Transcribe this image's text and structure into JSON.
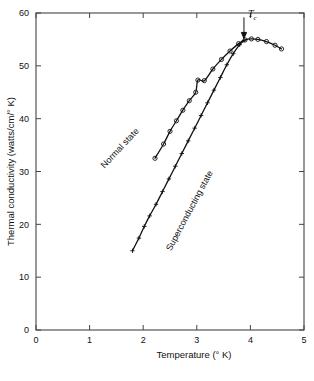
{
  "chart_data": {
    "type": "line",
    "title": "",
    "xlabel": "Temperature (° K)",
    "ylabel": "Thermal conductivity (watts/cm/° K)",
    "xlim": [
      0,
      5
    ],
    "ylim": [
      0,
      60
    ],
    "xticks": [
      0,
      1,
      2,
      3,
      4,
      5
    ],
    "yticks": [
      0,
      10,
      20,
      30,
      40,
      50,
      60
    ],
    "xtick_labels": [
      "0",
      "1",
      "2",
      "3",
      "4",
      "5"
    ],
    "ytick_labels": [
      "0",
      "10",
      "20",
      "30",
      "40",
      "50",
      "60"
    ],
    "grid": false,
    "legend_position": "inline-curve-labels",
    "series": [
      {
        "name": "Normal state",
        "marker": "open-circle",
        "label_rotation_deg": -47,
        "points": [
          {
            "x": 2.22,
            "y": 32.5
          },
          {
            "x": 2.38,
            "y": 35.2
          },
          {
            "x": 2.5,
            "y": 37.6
          },
          {
            "x": 2.62,
            "y": 39.6
          },
          {
            "x": 2.74,
            "y": 41.6
          },
          {
            "x": 2.86,
            "y": 43.4
          },
          {
            "x": 2.98,
            "y": 45.0
          },
          {
            "x": 3.02,
            "y": 47.3
          },
          {
            "x": 3.14,
            "y": 47.2
          },
          {
            "x": 3.3,
            "y": 49.4
          },
          {
            "x": 3.46,
            "y": 51.2
          },
          {
            "x": 3.62,
            "y": 52.8
          },
          {
            "x": 3.78,
            "y": 54.2
          },
          {
            "x": 3.9,
            "y": 54.9
          },
          {
            "x": 4.02,
            "y": 55.1
          },
          {
            "x": 4.14,
            "y": 55.0
          },
          {
            "x": 4.3,
            "y": 54.6
          },
          {
            "x": 4.46,
            "y": 53.9
          },
          {
            "x": 4.58,
            "y": 53.2
          }
        ]
      },
      {
        "name": "Superconducting state",
        "marker": "plus",
        "label_rotation_deg": -62,
        "points": [
          {
            "x": 1.8,
            "y": 15.0
          },
          {
            "x": 1.92,
            "y": 17.4
          },
          {
            "x": 2.02,
            "y": 19.6
          },
          {
            "x": 2.12,
            "y": 21.6
          },
          {
            "x": 2.24,
            "y": 23.8
          },
          {
            "x": 2.36,
            "y": 26.2
          },
          {
            "x": 2.48,
            "y": 28.6
          },
          {
            "x": 2.6,
            "y": 31.0
          },
          {
            "x": 2.72,
            "y": 33.4
          },
          {
            "x": 2.84,
            "y": 35.8
          },
          {
            "x": 2.96,
            "y": 38.2
          },
          {
            "x": 3.08,
            "y": 40.6
          },
          {
            "x": 3.2,
            "y": 43.0
          },
          {
            "x": 3.32,
            "y": 45.4
          },
          {
            "x": 3.44,
            "y": 47.8
          },
          {
            "x": 3.56,
            "y": 50.2
          },
          {
            "x": 3.68,
            "y": 52.3
          },
          {
            "x": 3.8,
            "y": 54.0
          },
          {
            "x": 3.88,
            "y": 54.8
          }
        ]
      }
    ],
    "annotations": [
      {
        "name": "critical-temperature",
        "text": "T",
        "subscript": "c",
        "x": 3.88,
        "y": 55.0,
        "arrow": "down"
      }
    ]
  }
}
